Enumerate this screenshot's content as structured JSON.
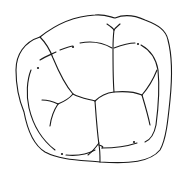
{
  "figure": {
    "stroke_color": "#1a1a1a",
    "background": "#ffffff"
  }
}
